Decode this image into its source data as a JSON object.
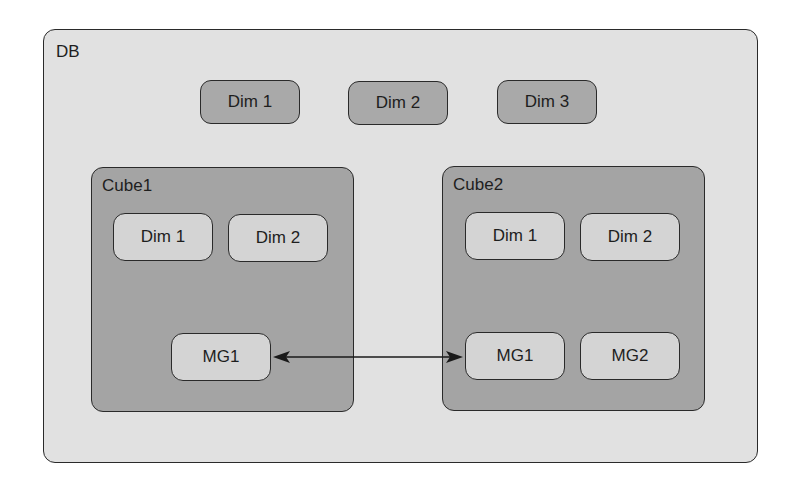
{
  "db": {
    "label": "DB",
    "dimensions": [
      "Dim 1",
      "Dim 2",
      "Dim 3"
    ]
  },
  "cubes": [
    {
      "label": "Cube1",
      "dimensions": [
        "Dim 1",
        "Dim 2"
      ],
      "measure_groups": [
        "MG1"
      ]
    },
    {
      "label": "Cube2",
      "dimensions": [
        "Dim 1",
        "Dim 2"
      ],
      "measure_groups": [
        "MG1",
        "MG2"
      ]
    }
  ],
  "links": [
    {
      "from": "Cube1.MG1",
      "to": "Cube2.MG1",
      "type": "bidirectional-arrow"
    }
  ],
  "colors": {
    "db_fill": "#e1e1e1",
    "db_dim_fill": "#a9a9a9",
    "cube_fill": "#a4a4a4",
    "cube_item_fill": "#d4d4d4",
    "stroke": "#2a2a2a"
  }
}
